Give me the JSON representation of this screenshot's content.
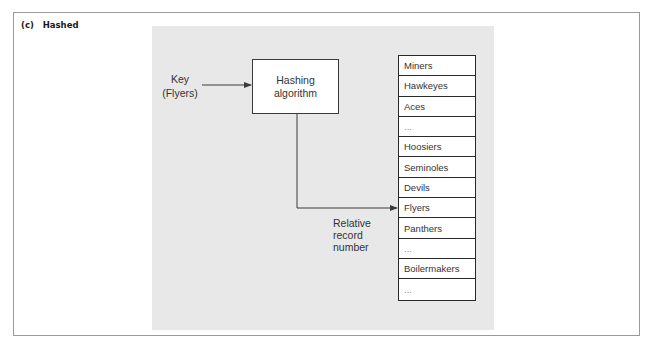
{
  "figure": {
    "caption": "(c)   Hashed"
  },
  "key": {
    "line1": "Key",
    "line2": "(Flyers)"
  },
  "hashing_box": {
    "line1": "Hashing",
    "line2": "algorithm"
  },
  "relative_label": {
    "line1": "Relative",
    "line2": "record",
    "line3": "number"
  },
  "records": [
    "Miners",
    "Hawkeyes",
    "Aces",
    "...",
    "Hoosiers",
    "Seminoles",
    "Devils",
    "Flyers",
    "Panthers",
    "...",
    "Boilermakers",
    "..."
  ],
  "target_record_index": 7,
  "colors": {
    "panel": "#e8e8e8",
    "lines": "#3a3a3a",
    "text": "#333333"
  }
}
